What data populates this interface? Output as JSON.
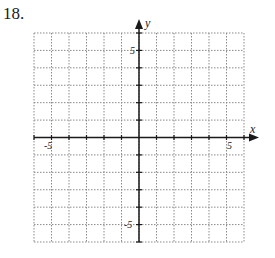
{
  "problem": {
    "number": "18."
  },
  "graph": {
    "x_axis_label": "x",
    "y_axis_label": "y",
    "x_range": [
      -6,
      6
    ],
    "y_range": [
      -6,
      6
    ],
    "grid_step": 1,
    "tick_labels": {
      "x_neg": "-5",
      "x_pos": "5",
      "y_pos": "5",
      "y_neg": "-5"
    },
    "colors": {
      "axis": "#1a1a1a",
      "grid": "#8a8a8a"
    }
  }
}
